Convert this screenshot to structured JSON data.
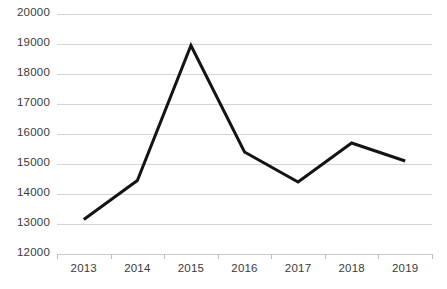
{
  "chart_data": {
    "type": "line",
    "title": "",
    "xlabel": "",
    "ylabel": "",
    "categories": [
      "2013",
      "2014",
      "2015",
      "2016",
      "2017",
      "2018",
      "2019"
    ],
    "values": [
      13150,
      14450,
      18950,
      15400,
      14400,
      15700,
      15100
    ],
    "series": [
      {
        "name": "",
        "values": [
          13150,
          14450,
          18950,
          15400,
          14400,
          15700,
          15100
        ]
      }
    ],
    "ylim": [
      12000,
      20000
    ],
    "ytick_labels": [
      "20000",
      "19000",
      "18000",
      "17000",
      "16000",
      "15000",
      "14000",
      "13000",
      "12000"
    ],
    "ytick_values": [
      20000,
      19000,
      18000,
      17000,
      16000,
      15000,
      14000,
      13000,
      12000
    ],
    "grid": true,
    "legend": "none",
    "line_color": "#141414",
    "grid_color": "#d4d4d4",
    "background_color": "#ffffff",
    "line_width": 3
  }
}
